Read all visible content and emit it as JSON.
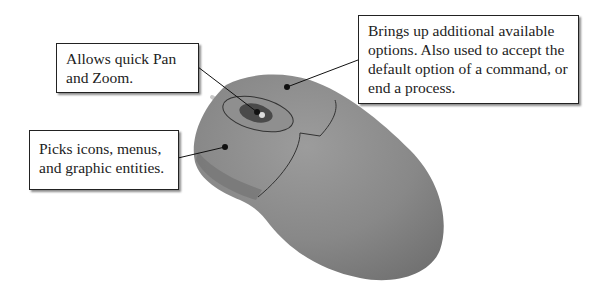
{
  "diagram": {
    "callouts": [
      {
        "id": "middle-wheel",
        "target": "scroll wheel",
        "lines": [
          "Allows quick Pan",
          "and Zoom."
        ]
      },
      {
        "id": "left-button",
        "target": "left mouse button",
        "lines": [
          "Picks icons, menus,",
          "and graphic entities."
        ]
      },
      {
        "id": "right-button",
        "target": "right mouse button",
        "lines": [
          "Brings up additional available",
          "options. Also used to accept the",
          "default option of a command, or",
          "end a process."
        ]
      }
    ],
    "colors": {
      "mouse_body": "#8a8a8a",
      "mouse_shadow": "#6e6e6e",
      "wheel": "#4a4a4a",
      "leader": "#111111",
      "box_border": "#222222"
    }
  }
}
